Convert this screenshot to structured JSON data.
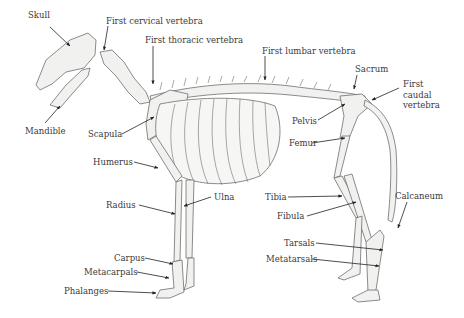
{
  "figure": {
    "labels": [
      {
        "id": "skull",
        "text": "Skull",
        "x": 28,
        "y": 15
      },
      {
        "id": "first-cervical-vertebra",
        "text": "First cervical vertebra",
        "x": 106,
        "y": 16
      },
      {
        "id": "first-thoracic-vertebra",
        "text": "First thoracic vertebra",
        "x": 145,
        "y": 35
      },
      {
        "id": "first-lumbar-vertebra",
        "text": "First lumbar vertebra",
        "x": 262,
        "y": 46
      },
      {
        "id": "sacrum",
        "text": "Sacrum",
        "x": 355,
        "y": 65
      },
      {
        "id": "first-caudal-vertebra",
        "text": "First\ncaudal\nvertebra",
        "x": 403,
        "y": 79
      },
      {
        "id": "mandible",
        "text": "Mandible",
        "x": 25,
        "y": 126
      },
      {
        "id": "scapula",
        "text": "Scapula",
        "x": 88,
        "y": 130
      },
      {
        "id": "pelvis",
        "text": "Pelvis",
        "x": 292,
        "y": 116
      },
      {
        "id": "femur",
        "text": "Femur",
        "x": 289,
        "y": 139
      },
      {
        "id": "humerus",
        "text": "Humerus",
        "x": 93,
        "y": 158
      },
      {
        "id": "ulna",
        "text": "Ulna",
        "x": 214,
        "y": 194
      },
      {
        "id": "radius",
        "text": "Radius",
        "x": 106,
        "y": 201
      },
      {
        "id": "tibia",
        "text": "Tibia",
        "x": 265,
        "y": 193
      },
      {
        "id": "fibula",
        "text": "Fibula",
        "x": 277,
        "y": 212
      },
      {
        "id": "calcaneum",
        "text": "Calcaneum",
        "x": 395,
        "y": 192
      },
      {
        "id": "tarsals",
        "text": "Tarsals",
        "x": 284,
        "y": 239
      },
      {
        "id": "metatarsals",
        "text": "Metatarsals",
        "x": 266,
        "y": 255
      },
      {
        "id": "carpus",
        "text": "Carpus",
        "x": 114,
        "y": 254
      },
      {
        "id": "metacarpals",
        "text": "Metacarpals",
        "x": 84,
        "y": 268
      },
      {
        "id": "phalanges",
        "text": "Phalanges",
        "x": 64,
        "y": 287
      }
    ]
  }
}
